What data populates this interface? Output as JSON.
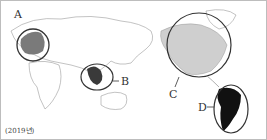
{
  "map": {
    "regions": [
      {
        "label": "A",
        "name": "Europe",
        "fill": "#7a7a7a"
      },
      {
        "label": "B",
        "name": "Southeast Asia",
        "fill": "#3a3a3a"
      },
      {
        "label": "C",
        "name": "North America",
        "fill": "#cfcfcf"
      },
      {
        "label": "D",
        "name": "South America",
        "fill": "#111111"
      }
    ],
    "caption": "(2019년)",
    "colors": {
      "outline": "#9a9a9a",
      "circle": "#333333",
      "land": "#ffffff"
    }
  }
}
